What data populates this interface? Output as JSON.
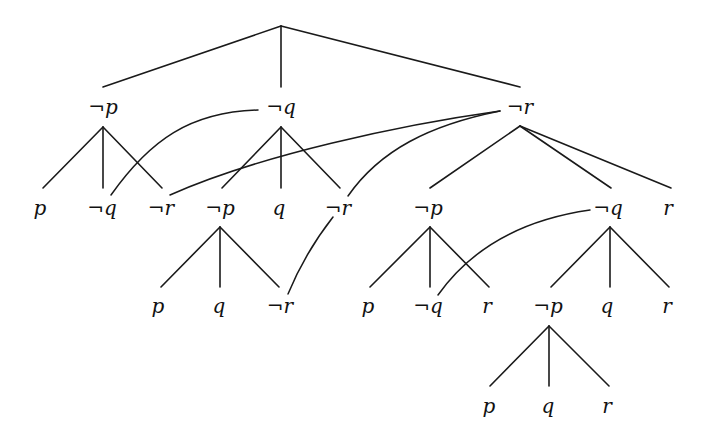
{
  "diagram": {
    "type": "semantic-tableau-tree",
    "root": {
      "label": ""
    },
    "nodes": {
      "L1_np": "¬p",
      "L1_nq": "¬q",
      "L1_nr": "¬r",
      "A_p": "p",
      "A_nq": "¬q",
      "A_nr": "¬r",
      "B_np": "¬p",
      "B_q": "q",
      "B_nr": "¬r",
      "C_np": "¬p",
      "C_nq": "¬q",
      "C_r": "r",
      "D_p": "p",
      "D_q": "q",
      "D_nr": "¬r",
      "E_p": "p",
      "E_nq": "¬q",
      "E_r": "r",
      "F_np": "¬p",
      "F_q": "q",
      "F_r": "r",
      "G_p": "p",
      "G_q": "q",
      "G_r": "r"
    },
    "tree_edges": [
      [
        "root",
        "L1_np"
      ],
      [
        "root",
        "L1_nq"
      ],
      [
        "root",
        "L1_nr"
      ],
      [
        "L1_np",
        "A_p"
      ],
      [
        "L1_np",
        "A_nq"
      ],
      [
        "L1_np",
        "A_nr"
      ],
      [
        "L1_nq",
        "B_np"
      ],
      [
        "L1_nq",
        "B_q"
      ],
      [
        "L1_nq",
        "B_nr"
      ],
      [
        "L1_nr",
        "C_np"
      ],
      [
        "L1_nr",
        "C_nq"
      ],
      [
        "L1_nr",
        "C_r"
      ],
      [
        "B_np",
        "D_p"
      ],
      [
        "B_np",
        "D_q"
      ],
      [
        "B_np",
        "D_nr"
      ],
      [
        "C_np",
        "E_p"
      ],
      [
        "C_np",
        "E_nq"
      ],
      [
        "C_np",
        "E_r"
      ],
      [
        "C_nq",
        "F_np"
      ],
      [
        "C_nq",
        "F_q"
      ],
      [
        "C_nq",
        "F_r"
      ],
      [
        "F_np",
        "G_p"
      ],
      [
        "F_np",
        "G_q"
      ],
      [
        "F_np",
        "G_r"
      ]
    ],
    "back_links": [
      [
        "A_nq",
        "L1_nq"
      ],
      [
        "A_nr",
        "L1_nr"
      ],
      [
        "B_nr",
        "L1_nr"
      ],
      [
        "D_nr",
        "B_nr"
      ],
      [
        "E_nq",
        "C_nq"
      ]
    ]
  }
}
